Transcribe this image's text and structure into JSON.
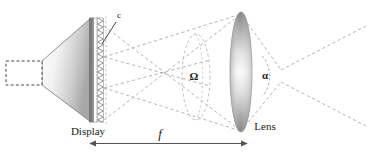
{
  "figure": {
    "type": "optical-diagram",
    "background_color": "#ffffff",
    "line_color": "#555555",
    "dashed_color": "#9a9a9a",
    "text_color": "#1a1a1a"
  },
  "labels": {
    "lenticular": "c",
    "display": "Display",
    "lens": "Lens",
    "solid_angle": "Ω",
    "view_angle": "α",
    "focal_length": "f"
  },
  "components": [
    {
      "name": "backlight-box",
      "label": "",
      "style": "dashed-rectangle",
      "x": 6,
      "y": 61,
      "width": 36,
      "height": 24
    },
    {
      "name": "projection-cone",
      "label": "",
      "style": "gradient-trapezoid",
      "apex_x": 42,
      "base_x": 92,
      "base_top_y": 18,
      "base_bottom_y": 122
    },
    {
      "name": "display-panel",
      "label": "Display",
      "style": "vertical-gradient-slab",
      "x": 90,
      "y": 18,
      "width": 5,
      "height": 104
    },
    {
      "name": "lenticular-array",
      "label": "c",
      "style": "sawtooth-column",
      "x": 98,
      "y": 18,
      "width": 6,
      "height": 104,
      "teeth": 34
    },
    {
      "name": "lens",
      "label": "Lens",
      "style": "gradient-ellipse",
      "cx": 241,
      "cy": 72,
      "rx": 11,
      "ry": 60
    },
    {
      "name": "solid-angle-ellipse",
      "label": "Ω",
      "style": "dashed-ellipse",
      "cx": 196,
      "cy": 77,
      "rx": 14,
      "ry": 43
    },
    {
      "name": "view-angle-arc",
      "label": "α",
      "style": "dashed-arc",
      "cx": 262,
      "cy": 76,
      "r": 20
    },
    {
      "name": "focal-length-arrow",
      "label": "f",
      "style": "double-headed-arrow",
      "x1": 95,
      "x2": 242,
      "y": 143
    }
  ],
  "axis_notes": {
    "focal_span_from": "Display",
    "focal_span_to": "Lens"
  }
}
